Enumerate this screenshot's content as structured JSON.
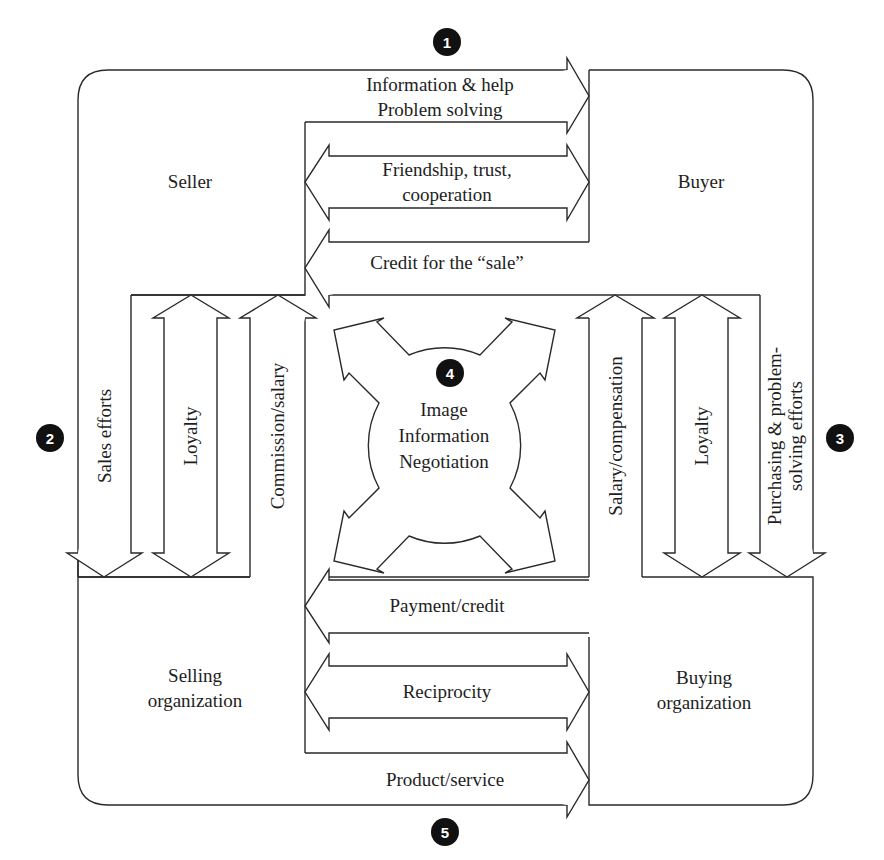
{
  "diagram": {
    "type": "exchange-relationship-diagram",
    "parties": {
      "seller": "Seller",
      "buyer": "Buyer",
      "selling_org_line1": "Selling",
      "selling_org_line2": "organization",
      "buying_org_line1": "Buying",
      "buying_org_line2": "organization"
    },
    "badges": [
      "1",
      "2",
      "3",
      "4",
      "5"
    ],
    "flows_top": {
      "info_line1": "Information & help",
      "info_line2": "Problem solving",
      "friendship_line1": "Friendship, trust,",
      "friendship_line2": "cooperation",
      "credit": "Credit for the “sale”"
    },
    "flows_left": {
      "sales_efforts": "Sales efforts",
      "loyalty": "Loyalty",
      "commission": "Commission/salary"
    },
    "flows_right": {
      "salary": "Salary/compensation",
      "loyalty": "Loyalty",
      "purchasing_line1": "Purchasing & problem-",
      "purchasing_line2": "solving efforts"
    },
    "center": {
      "line1": "Image",
      "line2": "Information",
      "line3": "Negotiation"
    },
    "flows_bottom": {
      "payment": "Payment/credit",
      "reciprocity": "Reciprocity",
      "product": "Product/service"
    }
  }
}
